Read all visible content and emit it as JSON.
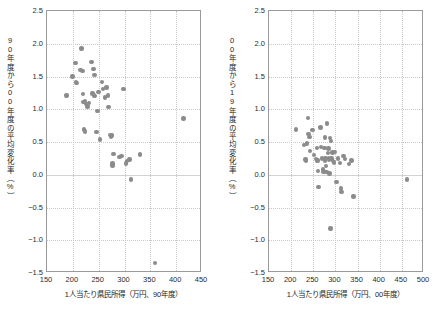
{
  "figure": {
    "background": "#ffffff",
    "marker_color": "#8b8b8b",
    "frame_color": "#9a9a9a",
    "grid_color": "#c9c9c9"
  },
  "chart_data": [
    {
      "type": "scatter",
      "panel": "left",
      "title": "",
      "xlabel": "1人当たり県民所得（万円、90年度）",
      "ylabel": "90年度から00年度の平均変化率（%）",
      "xlim": [
        150,
        450
      ],
      "ylim": [
        -1.5,
        2.5
      ],
      "xticks": [
        150,
        200,
        250,
        300,
        350,
        400,
        450
      ],
      "yticks": [
        -1.5,
        -1.0,
        -0.5,
        0.0,
        0.5,
        1.0,
        1.5,
        2.0,
        2.5
      ],
      "xtick_labels": [
        "150",
        "200",
        "250",
        "300",
        "350",
        "400",
        "450"
      ],
      "ytick_labels": [
        "-1.5",
        "-1.0",
        "-0.5",
        "0.0",
        "0.5",
        "1.0",
        "1.5",
        "2.0",
        "2.5"
      ],
      "grid": true,
      "legend": null,
      "points": [
        [
          188,
          1.21
        ],
        [
          199,
          1.5
        ],
        [
          205,
          1.71
        ],
        [
          206,
          1.41
        ],
        [
          208,
          1.4
        ],
        [
          215,
          1.6
        ],
        [
          217,
          1.93
        ],
        [
          219,
          1.58
        ],
        [
          220,
          1.23
        ],
        [
          221,
          1.11
        ],
        [
          222,
          0.69
        ],
        [
          223,
          0.66
        ],
        [
          224,
          1.13
        ],
        [
          226,
          1.08
        ],
        [
          228,
          1.04
        ],
        [
          231,
          1.1
        ],
        [
          236,
          1.72
        ],
        [
          238,
          1.24
        ],
        [
          240,
          1.61
        ],
        [
          241,
          1.21
        ],
        [
          242,
          1.52
        ],
        [
          243,
          1.2
        ],
        [
          246,
          0.65
        ],
        [
          248,
          0.97
        ],
        [
          250,
          1.26
        ],
        [
          253,
          0.54
        ],
        [
          256,
          1.42
        ],
        [
          258,
          1.31
        ],
        [
          262,
          1.18
        ],
        [
          265,
          1.33
        ],
        [
          268,
          1.21
        ],
        [
          269,
          1.03
        ],
        [
          272,
          0.61
        ],
        [
          274,
          0.58
        ],
        [
          276,
          0.6
        ],
        [
          277,
          0.17
        ],
        [
          277,
          0.14
        ],
        [
          279,
          0.32
        ],
        [
          290,
          0.27
        ],
        [
          294,
          0.29
        ],
        [
          298,
          1.31
        ],
        [
          303,
          0.17
        ],
        [
          305,
          0.21
        ],
        [
          310,
          0.23
        ],
        [
          313,
          -0.07
        ],
        [
          330,
          0.31
        ],
        [
          359,
          -1.35
        ],
        [
          414,
          0.86
        ]
      ]
    },
    {
      "type": "scatter",
      "panel": "right",
      "title": "",
      "xlabel": "1人当たり県民所得（万円、00年度）",
      "ylabel": "00年度から19年度の平均変化率（%）",
      "xlim": [
        150,
        500
      ],
      "ylim": [
        -1.5,
        2.5
      ],
      "xticks": [
        150,
        200,
        250,
        300,
        350,
        400,
        450,
        500
      ],
      "yticks": [
        -1.5,
        -1.0,
        -0.5,
        0.0,
        0.5,
        1.0,
        1.5,
        2.0,
        2.5
      ],
      "xtick_labels": [
        "150",
        "200",
        "250",
        "300",
        "350",
        "400",
        "450",
        "500"
      ],
      "ytick_labels": [
        "-1.5",
        "-1.0",
        "-0.5",
        "0.0",
        "0.5",
        "1.0",
        "1.5",
        "2.0",
        "2.5"
      ],
      "grid": true,
      "legend": null,
      "points": [
        [
          211,
          0.69
        ],
        [
          229,
          0.45
        ],
        [
          232,
          0.23
        ],
        [
          234,
          0.22
        ],
        [
          236,
          0.48
        ],
        [
          238,
          0.87
        ],
        [
          239,
          0.62
        ],
        [
          241,
          0.58
        ],
        [
          243,
          0.36
        ],
        [
          248,
          0.68
        ],
        [
          252,
          0.3
        ],
        [
          256,
          0.24
        ],
        [
          258,
          0.22
        ],
        [
          259,
          0.41
        ],
        [
          260,
          0.22
        ],
        [
          261,
          0.06
        ],
        [
          262,
          -0.19
        ],
        [
          266,
          0.72
        ],
        [
          268,
          0.42
        ],
        [
          270,
          0.25
        ],
        [
          272,
          0.08
        ],
        [
          273,
          0.05
        ],
        [
          275,
          0.41
        ],
        [
          276,
          0.22
        ],
        [
          277,
          0.57
        ],
        [
          278,
          0.26
        ],
        [
          279,
          0.13
        ],
        [
          280,
          0.04
        ],
        [
          281,
          0.78
        ],
        [
          283,
          0.33
        ],
        [
          284,
          0.4
        ],
        [
          285,
          0.25
        ],
        [
          286,
          0.23
        ],
        [
          287,
          0.02
        ],
        [
          288,
          0.56
        ],
        [
          289,
          -0.82
        ],
        [
          290,
          0.52
        ],
        [
          291,
          0.25
        ],
        [
          293,
          0.34
        ],
        [
          295,
          0.21
        ],
        [
          297,
          0.19
        ],
        [
          299,
          0.35
        ],
        [
          302,
          -0.11
        ],
        [
          306,
          0.25
        ],
        [
          310,
          0.18
        ],
        [
          312,
          -0.21
        ],
        [
          314,
          -0.26
        ],
        [
          318,
          0.29
        ],
        [
          322,
          0.24
        ],
        [
          330,
          0.16
        ],
        [
          336,
          0.22
        ],
        [
          341,
          -0.33
        ],
        [
          462,
          -0.07
        ]
      ]
    }
  ]
}
